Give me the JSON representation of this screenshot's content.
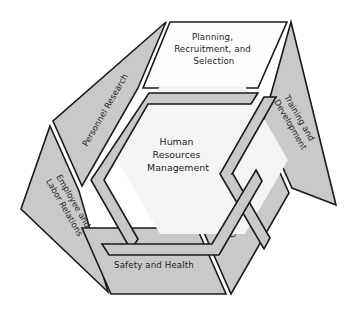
{
  "diagram": {
    "title_center": {
      "lines": [
        "Human",
        "Resources",
        "Management"
      ]
    },
    "panels": [
      {
        "id": "planning-recruitment-selection",
        "position": "top",
        "fill": "#fdfdfd",
        "lines": [
          "Planning,",
          "Recruitment, and",
          "Selection"
        ],
        "rotation_deg": 0
      },
      {
        "id": "training-and-development",
        "position": "upper-right",
        "fill": "#c9c9c9",
        "lines": [
          "Training and",
          "Development"
        ],
        "rotation_deg": 60
      },
      {
        "id": "compensation",
        "position": "lower-right",
        "fill": "#c9c9c9",
        "lines": [
          "Compensation"
        ],
        "rotation_deg": -60
      },
      {
        "id": "safety-and-health",
        "position": "bottom",
        "fill": "#c9c9c9",
        "lines": [
          "Safety and Health"
        ],
        "rotation_deg": 0
      },
      {
        "id": "employee-and-labor-relations",
        "position": "lower-left",
        "fill": "#c9c9c9",
        "lines": [
          "Employee and",
          "Labor Relations"
        ],
        "rotation_deg": 60
      },
      {
        "id": "personnel-research",
        "position": "upper-left",
        "fill": "#c9c9c9",
        "lines": [
          "Personnel Research"
        ],
        "rotation_deg": -60
      }
    ],
    "inner_arms": [
      {
        "id": "arm-upper-left"
      },
      {
        "id": "arm-right"
      },
      {
        "id": "arm-bottom"
      }
    ],
    "colors": {
      "panel_gray": "#c9c9c9",
      "panel_white": "#fdfdfd",
      "center_fill": "#f4f4f4",
      "outline": "#1a1a1a",
      "text": "#1c1c1c",
      "background": "#ffffff"
    }
  }
}
